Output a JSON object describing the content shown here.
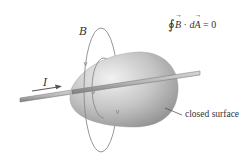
{
  "figure": {
    "labels": {
      "magnetic_field": "B",
      "current": "I",
      "surface": "closed surface"
    },
    "equation": {
      "integral_symbol": "∮",
      "field": "B",
      "dot": "·",
      "d": "d",
      "area": "A",
      "equals": "= 0"
    },
    "colors": {
      "surface_light": "#e6e6e6",
      "surface_dark": "#9a9a9a",
      "rod": "#b0b0b0",
      "rod_edge": "#707070",
      "field_lines": "#8a8a8a",
      "arrow": "#555555",
      "text": "#333333"
    }
  }
}
